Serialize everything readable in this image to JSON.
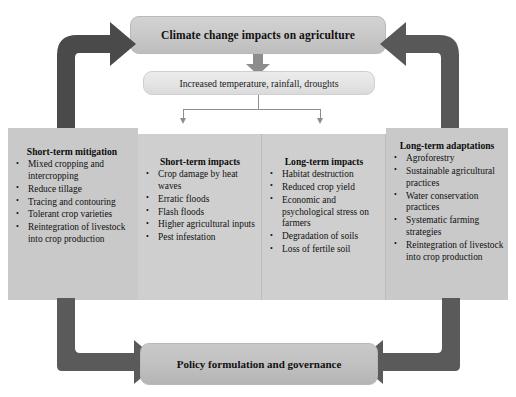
{
  "diagram": {
    "title": "Climate change impacts on agriculture",
    "driver": "Increased temperature, rainfall, droughts",
    "outcome": "Policy formulation and governance",
    "columns": [
      {
        "id": "short-term-mitigation",
        "heading": "Short-term mitigation",
        "items": [
          "Mixed cropping and intercropping",
          "Reduce tillage",
          "Tracing and contouring",
          "Tolerant crop varieties",
          "Reintegration of livestock into crop production"
        ]
      },
      {
        "id": "short-term-impacts",
        "heading": "Short-term impacts",
        "items": [
          "Crop damage by heat waves",
          "Erratic floods",
          "Flash floods",
          "Higher agricultural inputs",
          "Pest infestation"
        ]
      },
      {
        "id": "long-term-impacts",
        "heading": "Long-term impacts",
        "items": [
          "Habitat destruction",
          "Reduced crop yield",
          "Economic and psychological stress on farmers",
          "Degradation of soils",
          "Loss of fertile soil"
        ]
      },
      {
        "id": "long-term-adaptations",
        "heading": "Long-term adaptations",
        "items": [
          "Agroforestry",
          "Sustainable agricultural practices",
          "Water conservation practices",
          "Systematic farming strategies",
          "Reintegration of livestock into crop production"
        ]
      }
    ],
    "connectors": [
      {
        "name": "elbow-arrow-top-left",
        "from": "short-term-mitigation",
        "to": "title"
      },
      {
        "name": "elbow-arrow-top-right",
        "from": "long-term-adaptations",
        "to": "title"
      },
      {
        "name": "branch-connector",
        "from": "driver",
        "to": "impact-columns"
      },
      {
        "name": "elbow-arrow-bottom-left",
        "from": "short-term-mitigation",
        "to": "outcome"
      },
      {
        "name": "elbow-arrow-bottom-right",
        "from": "long-term-adaptations",
        "to": "outcome"
      },
      {
        "name": "down-arrow-title-driver",
        "from": "title",
        "to": "driver"
      }
    ],
    "colors": {
      "title_box": "#c8c8c8",
      "driver_box": "#e3e3e3",
      "panel": "#c9c9c9",
      "outcome_box": "#c0c0c0",
      "arrow_dark": "#4a4a4a",
      "arrow_mid": "#6e6e6e",
      "connector_thin": "#8e8e8e",
      "background": "#ffffff"
    }
  }
}
